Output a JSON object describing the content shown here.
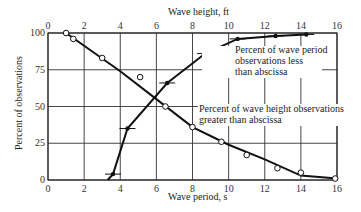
{
  "chart_data": {
    "type": "line",
    "title": "",
    "xlabel": "Wave period, s",
    "x2label": "Wave height, ft",
    "ylabel": "Percent of observations",
    "xlim": [
      0,
      16
    ],
    "ylim": [
      0,
      100
    ],
    "xticks": [
      "0",
      "2",
      "4",
      "6",
      "8",
      "10",
      "12",
      "14",
      "16"
    ],
    "x2ticks": [
      "0",
      "2",
      "4",
      "6",
      "8",
      "10",
      "12",
      "14",
      "16"
    ],
    "yticks": [
      "0",
      "25",
      "50",
      "75",
      "100"
    ],
    "grid": true,
    "series": [
      {
        "name": "Percent of wave period observations less than abscissa",
        "axis": "bottom (Wave period, s)",
        "marker": "filled-circle-with-bar",
        "x": [
          3.6,
          4.4,
          6.6,
          8.7,
          10.5,
          12.6,
          14.3
        ],
        "values": [
          4,
          35,
          66,
          86,
          96,
          98,
          99
        ]
      },
      {
        "name": "Percent of wave height observations greater than abscissa",
        "axis": "top (Wave height, ft)",
        "marker": "open-circle",
        "x": [
          1.0,
          1.4,
          3.0,
          5.1,
          6.5,
          8.0,
          9.6,
          11.0,
          12.7,
          14.0,
          15.9
        ],
        "values": [
          100,
          96,
          83,
          70,
          50,
          36,
          26,
          17,
          8,
          5,
          1
        ]
      }
    ],
    "annotations": [
      {
        "text": [
          "Percent of wave period",
          "observations less",
          "than abscissa"
        ]
      },
      {
        "text": [
          "Percent of wave height observations",
          "greater than abscissa"
        ]
      }
    ]
  },
  "labels": {
    "top_axis": "Wave height, ft",
    "bottom_axis": "Wave period, s",
    "y_axis": "Percent of observations",
    "ann1_l1": "Percent of wave period",
    "ann1_l2": "observations less",
    "ann1_l3": "than abscissa",
    "ann2_l1": "Percent of wave height observations",
    "ann2_l2": "greater than abscissa"
  }
}
